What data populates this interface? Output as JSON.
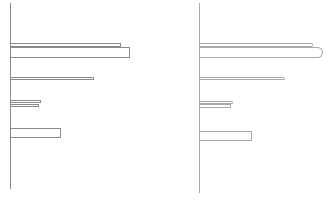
{
  "chart_data": [
    {
      "type": "bar",
      "orientation": "horizontal",
      "title": "",
      "xlabel": "",
      "ylabel": "",
      "grid": false,
      "legend": null,
      "style": "outline",
      "stroke_color": "#8a8a8a",
      "axis": {
        "x": 10,
        "top": 3,
        "bottom": 189
      },
      "bars": [
        {
          "y": 43,
          "h": 4,
          "value": 110
        },
        {
          "y": 47,
          "h": 11,
          "value": 119
        },
        {
          "y": 77,
          "h": 3,
          "value": 83
        },
        {
          "y": 100,
          "h": 3,
          "value": 30
        },
        {
          "y": 104,
          "h": 3,
          "value": 28
        },
        {
          "y": 128,
          "h": 10,
          "value": 50
        }
      ]
    },
    {
      "type": "bar",
      "orientation": "horizontal",
      "title": "",
      "xlabel": "",
      "ylabel": "",
      "grid": false,
      "legend": null,
      "style": "outline-rounded-end",
      "stroke_color": "#a8a8a8",
      "axis": {
        "x": 199,
        "top": 3,
        "bottom": 193
      },
      "bars": [
        {
          "y": 43,
          "h": 4,
          "value": 113,
          "radius": 2
        },
        {
          "y": 47,
          "h": 11,
          "value": 123,
          "radius": 8
        },
        {
          "y": 77,
          "h": 3,
          "value": 85,
          "radius": 2
        },
        {
          "y": 101,
          "h": 3,
          "value": 33,
          "radius": 2
        },
        {
          "y": 104,
          "h": 4,
          "value": 31,
          "radius": 1
        },
        {
          "y": 131,
          "h": 10,
          "value": 52,
          "radius": 0
        }
      ]
    }
  ]
}
